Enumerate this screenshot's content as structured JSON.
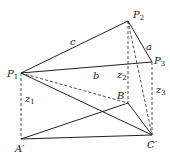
{
  "diagram": {
    "points": {
      "P1": {
        "label": "P",
        "sub": "1",
        "x": 21,
        "y": 73
      },
      "P2": {
        "label": "P",
        "sub": "2",
        "x": 128,
        "y": 21
      },
      "P3": {
        "label": "P",
        "sub": "3",
        "x": 152,
        "y": 62
      },
      "A": {
        "label": "A′",
        "x": 21,
        "y": 139
      },
      "B": {
        "label": "B′",
        "x": 128,
        "y": 103
      },
      "C": {
        "label": "C′",
        "x": 152,
        "y": 135
      }
    },
    "edge_labels": {
      "a": "a",
      "b": "b",
      "c": "c"
    },
    "heights": {
      "z1": {
        "label": "z",
        "sub": "1"
      },
      "z2": {
        "label": "z",
        "sub": "2"
      },
      "z3": {
        "label": "z",
        "sub": "3"
      }
    },
    "stroke_color": "#222222"
  }
}
